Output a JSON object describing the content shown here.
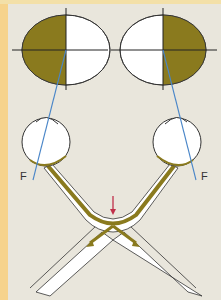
{
  "diagram": {
    "colors": {
      "background": "#e9e6dc",
      "side_stripe": "#f6d38c",
      "field_fill": "#8a7a1e",
      "nerve_fill": "#8a7a1e",
      "sight_line": "#4a86c8",
      "arrow": "#c0304a",
      "outline": "#333333"
    },
    "visual_fields": [
      {
        "id": "left",
        "filled_half": "left",
        "cx": 66,
        "cy": 50
      },
      {
        "id": "right",
        "filled_half": "right",
        "cx": 163,
        "cy": 50
      }
    ],
    "eyes": [
      {
        "id": "left",
        "label": "F",
        "cx": 46,
        "cy": 140
      },
      {
        "id": "right",
        "label": "F",
        "cx": 177,
        "cy": 140
      }
    ],
    "chiasm_arrow": {
      "direction": "down",
      "x": 113,
      "y_start": 195,
      "y_end": 214
    },
    "labels": {
      "left_fovea": "F",
      "right_fovea": "F"
    }
  }
}
